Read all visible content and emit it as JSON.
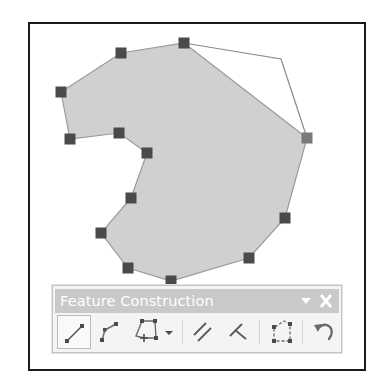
{
  "canvas": {
    "polygon_fill": "#d0d0d0",
    "polygon_stroke": "#9a9a9a",
    "vertex_color": "#4a4a4a",
    "active_vertex_color": "#7a7a7a",
    "frame_color": "#1a1a1a",
    "polygon_vertices": [
      [
        184,
        43
      ],
      [
        307,
        138
      ],
      [
        285,
        218
      ],
      [
        249,
        258
      ],
      [
        171,
        281
      ],
      [
        128,
        268
      ],
      [
        101,
        233
      ],
      [
        131,
        198
      ],
      [
        147,
        153
      ],
      [
        119,
        133
      ],
      [
        70,
        139
      ],
      [
        61,
        92
      ],
      [
        121,
        53
      ]
    ],
    "sketch_outline": [
      [
        184,
        43
      ],
      [
        281,
        59
      ],
      [
        307,
        138
      ]
    ],
    "vertex_markers": [
      {
        "x": 184,
        "y": 43
      },
      {
        "x": 121,
        "y": 53
      },
      {
        "x": 61,
        "y": 92
      },
      {
        "x": 70,
        "y": 139
      },
      {
        "x": 119,
        "y": 133
      },
      {
        "x": 147,
        "y": 153
      },
      {
        "x": 131,
        "y": 198
      },
      {
        "x": 101,
        "y": 233
      },
      {
        "x": 128,
        "y": 268
      },
      {
        "x": 171,
        "y": 281
      },
      {
        "x": 249,
        "y": 258
      },
      {
        "x": 285,
        "y": 218
      },
      {
        "x": 307,
        "y": 138,
        "active": true
      }
    ]
  },
  "toolbar": {
    "title": "Feature Construction",
    "menu_icon": "dropdown-triangle",
    "close_icon": "x",
    "title_bar_color": "#c9c9c9",
    "buttons": [
      {
        "name": "straight-segment",
        "icon": "straight-line-icon",
        "selected": true
      },
      {
        "name": "end-point-arc-segment",
        "icon": "polyline-icon",
        "selected": false
      },
      {
        "name": "construct-polygon",
        "icon": "polygon-add-vertex-icon",
        "selected": false,
        "has_dropdown": true
      },
      {
        "name": "parallel",
        "icon": "parallel-icon",
        "selected": false
      },
      {
        "name": "perpendicular",
        "icon": "perpendicular-icon",
        "selected": false
      },
      {
        "name": "right-angle",
        "icon": "right-angle-square-icon",
        "selected": false
      },
      {
        "name": "undo",
        "icon": "undo-icon",
        "selected": false
      }
    ]
  }
}
